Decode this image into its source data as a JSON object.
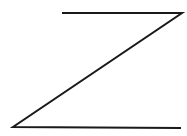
{
  "diagram": {
    "shape": "z-shape",
    "stroke_color": "#1a1a1a",
    "background": "#ffffff",
    "stroke_width": 2,
    "points": [
      [
        62,
        13
      ],
      [
        182,
        13
      ],
      [
        13,
        127
      ],
      [
        181,
        128
      ]
    ]
  }
}
